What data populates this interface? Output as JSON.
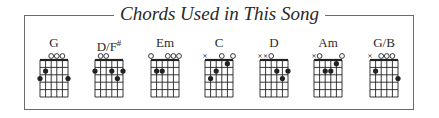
{
  "title": "Chords Used in This Song",
  "colors": {
    "frame": "#6b6b6b",
    "ink": "#222222",
    "background": "#ffffff"
  },
  "diagram": {
    "strings": 6,
    "frets_shown": 5
  },
  "chords": [
    {
      "name": "G",
      "suffix": "",
      "x": 26,
      "strings": [
        "3",
        "2",
        "0",
        "0",
        "0",
        "3"
      ]
    },
    {
      "name": "D/F",
      "suffix": "#",
      "x": 81,
      "strings": [
        "2",
        "0",
        "0",
        "2",
        "3",
        "2"
      ]
    },
    {
      "name": "Em",
      "suffix": "",
      "x": 137,
      "strings": [
        "0",
        "2",
        "2",
        "0",
        "0",
        "0"
      ]
    },
    {
      "name": "C",
      "suffix": "",
      "x": 191,
      "strings": [
        "x",
        "3",
        "2",
        "0",
        "1",
        "0"
      ]
    },
    {
      "name": "D",
      "suffix": "",
      "x": 246,
      "strings": [
        "x",
        "x",
        "0",
        "2",
        "3",
        "2"
      ]
    },
    {
      "name": "Am",
      "suffix": "",
      "x": 300,
      "strings": [
        "x",
        "0",
        "2",
        "2",
        "1",
        "0"
      ]
    },
    {
      "name": "G/B",
      "suffix": "",
      "x": 356,
      "strings": [
        "x",
        "2",
        "0",
        "0",
        "0",
        "3"
      ]
    }
  ]
}
